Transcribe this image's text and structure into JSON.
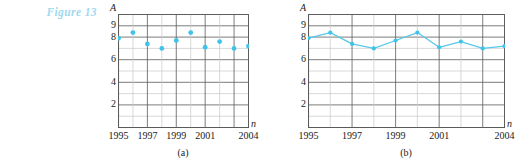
{
  "figure": {
    "label": "Figure 13",
    "color": "#9fd9ee"
  },
  "style": {
    "grid_color": "#5a5a5a",
    "grid_light_color": "#c9c9c9",
    "marker_color": "#3fc3e8",
    "line_color": "#58c9e8",
    "text_color": "#1a1a1a"
  },
  "panel_a": {
    "caption": "(a)",
    "y_axis_name": "A",
    "x_axis_name": "n",
    "y_ticks": [
      "9",
      "8",
      "6",
      "4",
      "2"
    ],
    "x_ticks": [
      "1995",
      "1997",
      "1999",
      "2001",
      "2004"
    ]
  },
  "panel_b": {
    "caption": "(b)",
    "y_axis_name": "A",
    "x_axis_name": "n",
    "y_ticks": [
      "9",
      "8",
      "6",
      "4",
      "2"
    ],
    "x_ticks": [
      "1995",
      "1997",
      "1999",
      "2001",
      "2004"
    ]
  },
  "chart_data": [
    {
      "type": "scatter",
      "title": "(a)",
      "xlabel": "n",
      "ylabel": "A",
      "x": [
        1995,
        1996,
        1997,
        1998,
        1999,
        2000,
        2001,
        2002,
        2003,
        2004
      ],
      "values": [
        7.9,
        8.4,
        7.4,
        7.0,
        7.7,
        8.4,
        7.1,
        7.6,
        7.0,
        7.2
      ],
      "categories": [
        "1995",
        "1996",
        "1997",
        "1998",
        "1999",
        "2000",
        "2001",
        "2002",
        "2003",
        "2004"
      ],
      "xlim": [
        1995,
        2004
      ],
      "ylim": [
        0,
        10
      ],
      "y_tick_values": [
        2,
        4,
        6,
        8,
        9
      ],
      "x_tick_values": [
        1995,
        1997,
        1999,
        2001,
        2004
      ],
      "grid": true,
      "legend": "none",
      "marker_color": "#3fc3e8"
    },
    {
      "type": "line",
      "title": "(b)",
      "xlabel": "n",
      "ylabel": "A",
      "x": [
        1995,
        1996,
        1997,
        1998,
        1999,
        2000,
        2001,
        2002,
        2003,
        2004
      ],
      "values": [
        7.9,
        8.4,
        7.4,
        7.0,
        7.7,
        8.4,
        7.1,
        7.6,
        7.0,
        7.2
      ],
      "categories": [
        "1995",
        "1996",
        "1997",
        "1998",
        "1999",
        "2000",
        "2001",
        "2002",
        "2003",
        "2004"
      ],
      "xlim": [
        1995,
        2004
      ],
      "ylim": [
        0,
        10
      ],
      "y_tick_values": [
        2,
        4,
        6,
        8,
        9
      ],
      "x_tick_values": [
        1995,
        1997,
        1999,
        2001,
        2004
      ],
      "grid": true,
      "legend": "none",
      "marker_color": "#3fc3e8",
      "line_color": "#58c9e8"
    }
  ]
}
